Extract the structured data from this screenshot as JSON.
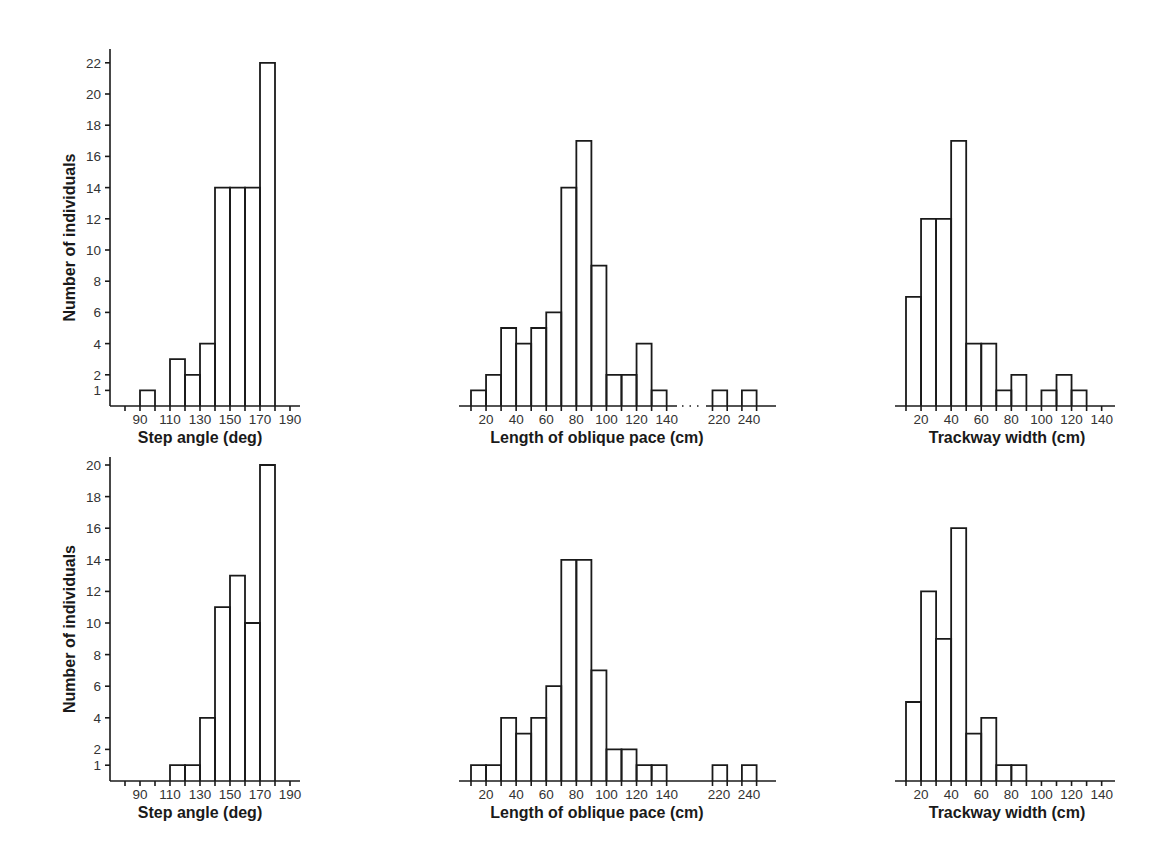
{
  "figure": {
    "rows": 2,
    "columns": 3,
    "ylabel": "Number of individuals"
  },
  "chart_data": [
    {
      "id": "top-step-angle",
      "type": "bar",
      "histogram": true,
      "row": 0,
      "col": 0,
      "xlabel": "Step angle (deg)",
      "ylabel": "Number of individuals",
      "bin_width": 10,
      "bins": [
        [
          90,
          100,
          1
        ],
        [
          100,
          110,
          0
        ],
        [
          110,
          120,
          3
        ],
        [
          120,
          130,
          2
        ],
        [
          130,
          140,
          4
        ],
        [
          140,
          150,
          14
        ],
        [
          150,
          160,
          14
        ],
        [
          160,
          170,
          14
        ],
        [
          170,
          180,
          22
        ]
      ],
      "xticks": [
        90,
        110,
        130,
        150,
        170,
        190
      ],
      "xminor": [
        80,
        90,
        100,
        110,
        120,
        130,
        140,
        150,
        160,
        170,
        180,
        190
      ],
      "yticks": [
        1,
        2,
        4,
        6,
        8,
        10,
        12,
        14,
        16,
        18,
        20,
        22
      ],
      "xlim": [
        70,
        195
      ],
      "ylim": [
        0,
        23.5
      ]
    },
    {
      "id": "top-oblique-pace",
      "type": "bar",
      "histogram": true,
      "row": 0,
      "col": 1,
      "xlabel": "Length of oblique pace (cm)",
      "bin_width": 10,
      "bins": [
        [
          10,
          20,
          1
        ],
        [
          20,
          30,
          2
        ],
        [
          30,
          40,
          5
        ],
        [
          40,
          50,
          4
        ],
        [
          50,
          60,
          5
        ],
        [
          60,
          70,
          6
        ],
        [
          70,
          80,
          14
        ],
        [
          80,
          90,
          17
        ],
        [
          90,
          100,
          9
        ],
        [
          100,
          110,
          2
        ],
        [
          110,
          120,
          2
        ],
        [
          120,
          130,
          4
        ],
        [
          130,
          140,
          1
        ],
        [
          215,
          225,
          1
        ],
        [
          235,
          245,
          1
        ]
      ],
      "xticks": [
        20,
        40,
        60,
        80,
        100,
        120,
        140,
        220,
        240
      ],
      "axis_break": true,
      "yticks": [],
      "ylim": [
        0,
        23.5
      ]
    },
    {
      "id": "top-trackway-width",
      "type": "bar",
      "histogram": true,
      "row": 0,
      "col": 2,
      "xlabel": "Trackway width (cm)",
      "bin_width": 10,
      "bins": [
        [
          10,
          20,
          7
        ],
        [
          20,
          30,
          12
        ],
        [
          30,
          40,
          12
        ],
        [
          40,
          50,
          17
        ],
        [
          50,
          60,
          4
        ],
        [
          60,
          70,
          4
        ],
        [
          70,
          80,
          1
        ],
        [
          80,
          90,
          2
        ],
        [
          90,
          100,
          0
        ],
        [
          100,
          110,
          1
        ],
        [
          110,
          120,
          2
        ],
        [
          120,
          130,
          1
        ]
      ],
      "xticks": [
        20,
        40,
        60,
        80,
        100,
        120,
        140
      ],
      "yticks": [],
      "ylim": [
        0,
        23.5
      ]
    },
    {
      "id": "bottom-step-angle",
      "type": "bar",
      "histogram": true,
      "row": 1,
      "col": 0,
      "xlabel": "Step angle (deg)",
      "ylabel": "Number of individuals",
      "bin_width": 10,
      "bins": [
        [
          110,
          120,
          1
        ],
        [
          120,
          130,
          1
        ],
        [
          130,
          140,
          4
        ],
        [
          140,
          150,
          11
        ],
        [
          150,
          160,
          13
        ],
        [
          160,
          170,
          10
        ],
        [
          170,
          180,
          20
        ]
      ],
      "xticks": [
        90,
        110,
        130,
        150,
        170,
        190
      ],
      "xminor": [
        80,
        90,
        100,
        110,
        120,
        130,
        140,
        150,
        160,
        170,
        180,
        190
      ],
      "yticks": [
        1,
        2,
        4,
        6,
        8,
        10,
        12,
        14,
        16,
        18,
        20
      ],
      "xlim": [
        70,
        195
      ],
      "ylim": [
        0,
        20.5
      ]
    },
    {
      "id": "bottom-oblique-pace",
      "type": "bar",
      "histogram": true,
      "row": 1,
      "col": 1,
      "xlabel": "Length of oblique pace (cm)",
      "bin_width": 10,
      "bins": [
        [
          10,
          20,
          1
        ],
        [
          20,
          30,
          1
        ],
        [
          30,
          40,
          4
        ],
        [
          40,
          50,
          3
        ],
        [
          50,
          60,
          4
        ],
        [
          60,
          70,
          6
        ],
        [
          70,
          80,
          14
        ],
        [
          80,
          90,
          14
        ],
        [
          90,
          100,
          7
        ],
        [
          100,
          110,
          2
        ],
        [
          110,
          120,
          2
        ],
        [
          120,
          130,
          1
        ],
        [
          130,
          140,
          1
        ],
        [
          215,
          225,
          1
        ],
        [
          235,
          245,
          1
        ]
      ],
      "xticks": [
        20,
        40,
        60,
        80,
        100,
        120,
        140,
        220,
        240
      ],
      "axis_break": false,
      "yticks": [],
      "ylim": [
        0,
        20.5
      ]
    },
    {
      "id": "bottom-trackway-width",
      "type": "bar",
      "histogram": true,
      "row": 1,
      "col": 2,
      "xlabel": "Trackway width (cm)",
      "bin_width": 10,
      "bins": [
        [
          10,
          20,
          5
        ],
        [
          20,
          30,
          12
        ],
        [
          30,
          40,
          9
        ],
        [
          40,
          50,
          16
        ],
        [
          50,
          60,
          3
        ],
        [
          60,
          70,
          4
        ],
        [
          70,
          80,
          1
        ],
        [
          80,
          90,
          1
        ]
      ],
      "xticks": [
        20,
        40,
        60,
        80,
        100,
        120,
        140
      ],
      "yticks": [],
      "ylim": [
        0,
        20.5
      ]
    }
  ]
}
